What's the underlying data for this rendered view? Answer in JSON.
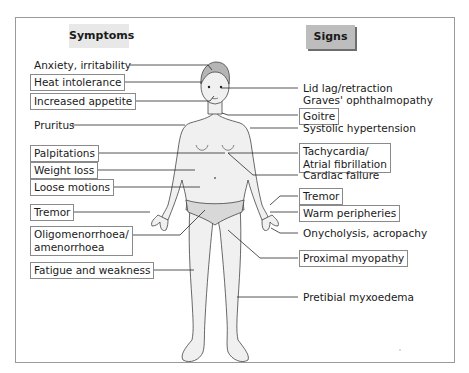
{
  "diagram": {
    "headers": {
      "symptoms": "Symptoms",
      "signs": "Signs"
    },
    "symptoms": [
      {
        "text": "Anxiety, irritability",
        "boxed": false
      },
      {
        "text": "Heat intolerance",
        "boxed": true
      },
      {
        "text": "Increased appetite",
        "boxed": true
      },
      {
        "text": "Pruritus",
        "boxed": false
      },
      {
        "text": "Palpitations",
        "boxed": true
      },
      {
        "text": "Weight loss",
        "boxed": true
      },
      {
        "text": "Loose motions",
        "boxed": true
      },
      {
        "text": "Tremor",
        "boxed": true
      },
      {
        "text": "Oligomenorrhoea/",
        "text2": "amenorrhoea",
        "boxed": true
      },
      {
        "text": "Fatigue and weakness",
        "boxed": true
      }
    ],
    "signs": [
      {
        "text": "Lid lag/retraction",
        "boxed": false
      },
      {
        "text": "Graves' ophthalmopathy",
        "boxed": false
      },
      {
        "text": "Goitre",
        "boxed": true
      },
      {
        "text": "Systolic hypertension",
        "boxed": false
      },
      {
        "text": "Tachycardia/",
        "text2": "Atrial fibrillation",
        "boxed": true
      },
      {
        "text": "Cardiac failure",
        "boxed": false
      },
      {
        "text": "Tremor",
        "boxed": true
      },
      {
        "text": "Warm peripheries",
        "boxed": true
      },
      {
        "text": "Onycholysis, acropachy",
        "boxed": false
      },
      {
        "text": "Proximal myopathy",
        "boxed": true
      },
      {
        "text": "Pretibial myxoedema",
        "boxed": false
      }
    ],
    "colors": {
      "symptoms_header_bg": "#e8e8e8",
      "signs_header_bg": "#bdbdbd",
      "body_fill": "#f0f0f0",
      "hair_fill": "#b5b5b5",
      "line": "#2a2a2a"
    }
  }
}
